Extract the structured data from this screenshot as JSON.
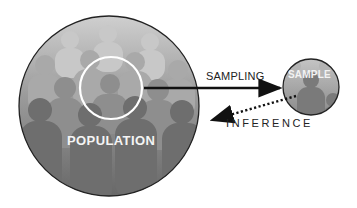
{
  "diagram": {
    "population": {
      "label": "POPULATION",
      "shape": "large circle of crowd silhouettes",
      "fill_top": "#b9b9b9",
      "fill_bottom": "#6a6a6a",
      "highlight_circle_color": "#ffffff"
    },
    "sample": {
      "label": "SAMPLE",
      "shape": "small circle with silhouettes"
    },
    "edges": [
      {
        "from": "population",
        "to": "sample",
        "label": "SAMPLING",
        "style": "solid-arrow"
      },
      {
        "from": "sample",
        "to": "population",
        "label": "INFERENCE",
        "style": "dotted-arrow"
      }
    ],
    "colors": {
      "outline": "#222222",
      "arrow": "#111111",
      "label_dark": "#222222",
      "label_light": "#f4f4f4"
    }
  }
}
